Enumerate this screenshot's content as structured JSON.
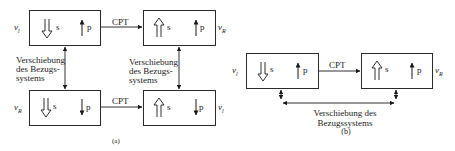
{
  "diagram_a": {
    "caption": "(a)",
    "boxes": [
      {
        "id": "top-left",
        "side_label": "ν",
        "side_sub": "l",
        "spin_symbol": "s",
        "spin_dir": "down",
        "momentum_symbol": "p",
        "momentum_dir": "up"
      },
      {
        "id": "top-right",
        "side_label": "ν",
        "side_sub": "R",
        "spin_symbol": "s",
        "spin_dir": "up",
        "momentum_symbol": "p",
        "momentum_dir": "up"
      },
      {
        "id": "bottom-left",
        "side_label": "ν",
        "side_sub": "R",
        "spin_symbol": "s",
        "spin_dir": "down",
        "momentum_symbol": "p",
        "momentum_dir": "down"
      },
      {
        "id": "bottom-right",
        "side_label": "ν",
        "side_sub": "l",
        "spin_symbol": "s",
        "spin_dir": "up",
        "momentum_symbol": "p",
        "momentum_dir": "down"
      }
    ],
    "arrows": {
      "cpt_top": "CPT",
      "cpt_bottom": "CPT"
    },
    "left_note": [
      "Verschiebung",
      "des Bezugs-",
      "systems"
    ],
    "right_note": [
      "Verschiebung",
      "des Bezugs-",
      "systems"
    ]
  },
  "diagram_b": {
    "caption": "(b)",
    "boxes": [
      {
        "id": "left",
        "side_label": "ν",
        "side_sub": "l",
        "spin_symbol": "s",
        "spin_dir": "down",
        "momentum_symbol": "p",
        "momentum_dir": "up"
      },
      {
        "id": "right",
        "side_label": "ν",
        "side_sub": "R",
        "spin_symbol": "s",
        "spin_dir": "up",
        "momentum_symbol": "p",
        "momentum_dir": "up"
      }
    ],
    "arrows": {
      "cpt": "CPT"
    },
    "note": [
      "Verschiebung des",
      "Bezugssystems"
    ]
  }
}
